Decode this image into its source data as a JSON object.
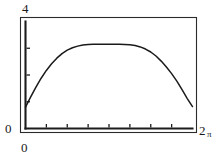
{
  "chart_data": {
    "type": "line",
    "title": "",
    "xlabel": "",
    "ylabel": "",
    "xlim": [
      0,
      6.283185307
    ],
    "ylim": [
      0,
      4
    ],
    "grid": false,
    "legend": null,
    "x_tick_labels": [
      "0",
      "2π"
    ],
    "y_tick_labels": [
      "0",
      "4"
    ],
    "x_tick_values": [
      0,
      6.283185307
    ],
    "y_tick_values": [
      0,
      4
    ],
    "x_minor_tick_count": 7,
    "y_minor_tick_count": 3,
    "series": [
      {
        "name": "curve",
        "x": [
          0.0,
          0.196,
          0.393,
          0.589,
          0.785,
          0.982,
          1.178,
          1.374,
          1.571,
          1.767,
          1.963,
          2.16,
          2.356,
          2.553,
          2.749,
          2.945,
          3.142,
          3.338,
          3.534,
          3.731,
          3.927,
          4.123,
          4.32,
          4.516,
          4.712,
          4.909,
          5.105,
          5.301,
          5.498,
          5.694,
          5.89,
          6.087,
          6.283
        ],
        "y": [
          0.8,
          1.18,
          1.55,
          1.88,
          2.17,
          2.42,
          2.63,
          2.8,
          2.93,
          3.02,
          3.08,
          3.12,
          3.14,
          3.15,
          3.15,
          3.15,
          3.15,
          3.15,
          3.15,
          3.14,
          3.13,
          3.1,
          3.05,
          2.97,
          2.86,
          2.71,
          2.52,
          2.3,
          2.05,
          1.77,
          1.45,
          1.12,
          0.82
        ]
      }
    ]
  },
  "labels": {
    "y_max": "4",
    "y_min": "0",
    "x_min": "0",
    "x_max_number": "2",
    "x_max_symbol": "π"
  },
  "colors": {
    "curve": "#1a1a1a",
    "axis": "#1c1c1c",
    "frame": "#2b2b2b",
    "background": "#ffffff",
    "text": "#1a1a1a"
  }
}
